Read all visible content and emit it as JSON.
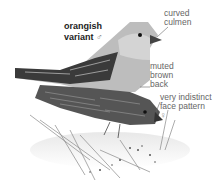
{
  "illustration": {
    "subject": "two finches (male orangish variant and female) perched on grass",
    "labels": {
      "variant_line1": "orangish",
      "variant_line2": "variant",
      "male_symbol": "♂",
      "curved_line1": "curved",
      "curved_line2": "culmen",
      "muted_line1": "muted",
      "muted_line2": "brown",
      "muted_line3": "back",
      "face_line1": "very indistinct",
      "face_line2": "face pattern",
      "female_symbol": "♀"
    }
  }
}
